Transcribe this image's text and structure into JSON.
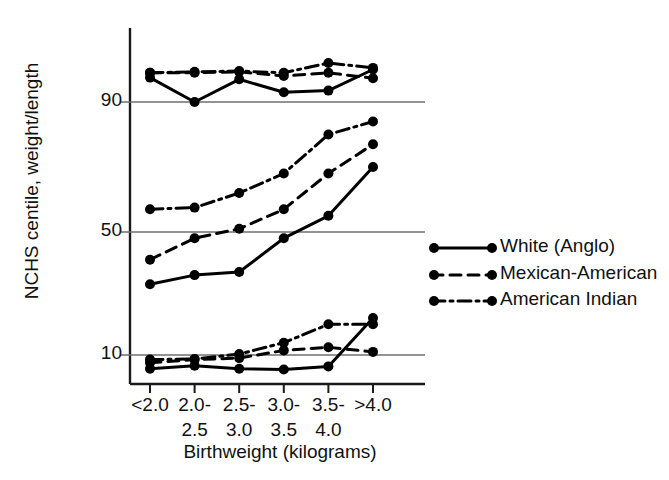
{
  "chart_data": {
    "type": "line",
    "title": "",
    "xlabel": "Birthweight  (kilograms)",
    "ylabel": "NCHS centile, weight/length",
    "categories": [
      "<2.0",
      "2.0-\n2.5",
      "2.5-\n3.0",
      "3.0-\n3.5",
      "3.5-\n4.0",
      ">4.0"
    ],
    "x_tick_top": [
      "<2.0",
      "2.0-",
      "2.5-",
      "3.0-",
      "3.5-",
      ">4.0"
    ],
    "x_tick_bottom": [
      "",
      "2.5",
      "3.0",
      "3.5",
      "4.0",
      ""
    ],
    "y_ticks": [
      10,
      50,
      90
    ],
    "ylim": [
      2,
      104
    ],
    "grid": "horizontal-at-yticks",
    "legend_position": "right",
    "series": [
      {
        "name": "White (Anglo)",
        "style": "solid",
        "color": "#000000",
        "bands": [
          {
            "band": "upper",
            "values": [
              97.5,
              90.0,
              97.0,
              93.0,
              93.5,
              100.0
            ]
          },
          {
            "band": "middle",
            "values": [
              33.0,
              36.0,
              37.0,
              48.0,
              55.0,
              70.0
            ]
          },
          {
            "band": "lower",
            "values": [
              5.5,
              6.5,
              5.5,
              5.3,
              6.3,
              22.0
            ]
          }
        ]
      },
      {
        "name": "Mexican-American",
        "style": "dashed",
        "color": "#000000",
        "bands": [
          {
            "band": "upper",
            "values": [
              99.0,
              99.0,
              99.3,
              98.0,
              99.0,
              97.3
            ]
          },
          {
            "band": "middle",
            "values": [
              41.0,
              48.0,
              51.0,
              57.0,
              68.0,
              77.0
            ]
          },
          {
            "band": "lower",
            "values": [
              7.5,
              8.5,
              9.0,
              11.5,
              12.5,
              11.0
            ]
          }
        ]
      },
      {
        "name": "American Indian",
        "style": "dashdot",
        "color": "#000000",
        "bands": [
          {
            "band": "upper",
            "values": [
              99.0,
              99.3,
              99.5,
              99.0,
              102.0,
              100.5
            ]
          },
          {
            "band": "middle",
            "values": [
              57.0,
              57.5,
              62.0,
              68.0,
              80.0,
              84.0
            ]
          },
          {
            "band": "lower",
            "values": [
              8.5,
              8.7,
              10.3,
              14.0,
              20.0,
              20.0
            ]
          }
        ]
      }
    ]
  },
  "axis": {
    "y_tick_90": "90",
    "y_tick_50": "50",
    "y_tick_10": "10",
    "y_title": "NCHS centile, weight/length",
    "x_title": "Birthweight  (kilograms)"
  },
  "legend": {
    "items": [
      {
        "label": "White (Anglo)",
        "style": "solid"
      },
      {
        "label": "Mexican-American",
        "style": "dashed"
      },
      {
        "label": "American Indian",
        "style": "dashdot"
      }
    ]
  }
}
